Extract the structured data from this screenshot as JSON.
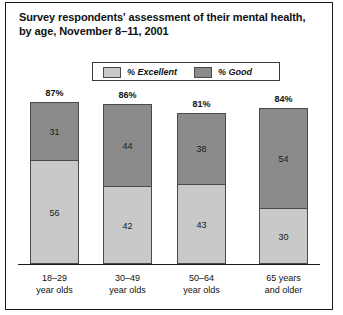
{
  "chart_data": {
    "type": "bar",
    "subtype": "stacked-vertical",
    "title": "Survey respondents' assessment of their mental health, by age, November 8–11, 2001",
    "xlabel": "",
    "ylabel": "",
    "ylim": [
      0,
      100
    ],
    "grid": false,
    "legend_position": "top-center",
    "categories": [
      "18–29 year olds",
      "30–49 year olds",
      "50–64 year olds",
      "65 years and older"
    ],
    "category_lines": [
      [
        "18–29",
        "year olds"
      ],
      [
        "30–49",
        "year olds"
      ],
      [
        "50–64",
        "year olds"
      ],
      [
        "65 years",
        "and older"
      ]
    ],
    "series": [
      {
        "name": "% Excellent",
        "color": "#c9c9c9",
        "values": [
          56,
          42,
          43,
          30
        ]
      },
      {
        "name": "% Good",
        "color": "#8b8b8b",
        "values": [
          31,
          44,
          38,
          54
        ]
      }
    ],
    "totals": [
      87,
      86,
      81,
      84
    ],
    "total_labels": [
      "87%",
      "86%",
      "81%",
      "84%"
    ],
    "stack_order_top_to_bottom": [
      "% Good",
      "% Excellent"
    ]
  },
  "legend": {
    "items": [
      {
        "label": "% Excellent",
        "color": "#c9c9c9"
      },
      {
        "label": "% Good",
        "color": "#8b8b8b"
      }
    ]
  },
  "colors": {
    "excellent": "#c9c9c9",
    "good": "#8b8b8b",
    "outline": "#4a4a4a",
    "axis": "#1a1a1a",
    "text": "#111111",
    "background": "#ffffff"
  }
}
